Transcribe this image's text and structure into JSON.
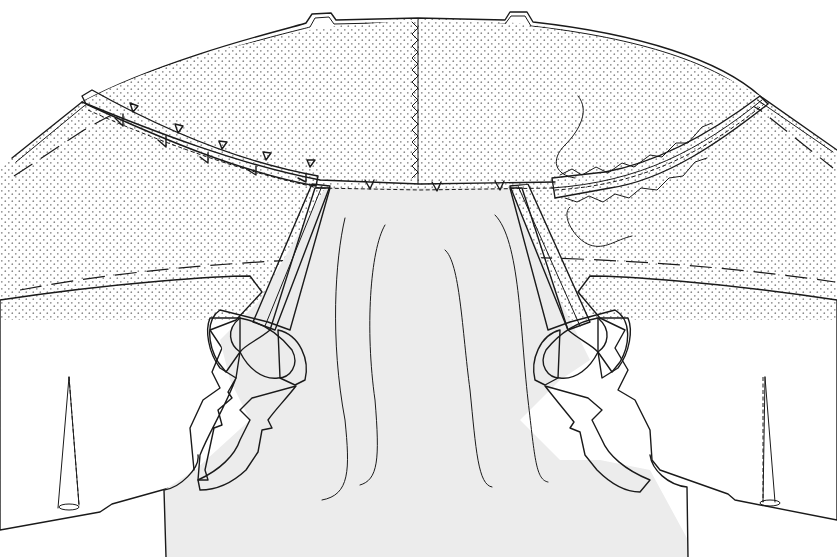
{
  "figure": {
    "type": "technical-sewing-illustration",
    "text_labels": []
  },
  "colors": {
    "background": "#ffffff",
    "garment_fill": "#ececec",
    "collar_fill": "#ffffff",
    "collar_dots": "#8a8a8a",
    "tape_fill": "#d6d6d6",
    "turnback_fill": "#d9d9d9",
    "ink": "#1a1a1a"
  },
  "parts": {
    "collar": {
      "name": "collar (dotted interfacing)",
      "notches_top": 2,
      "center_seam": "zigzag stitched"
    },
    "left_neckline_tape": {
      "clips": 5,
      "tailor_tacks": 5
    },
    "right_neckline_tape": {
      "stitch": "cross-stitch (herringbone)"
    },
    "shoulder_tapes": 2,
    "darts": 2,
    "drape_lines": 4
  }
}
